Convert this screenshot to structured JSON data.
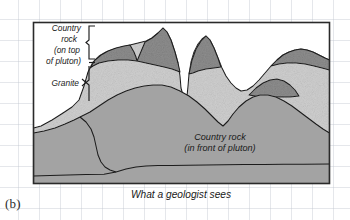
{
  "figure": {
    "panel_label": "(b)",
    "caption": "What a geologist sees"
  },
  "annotations": {
    "country_rock_top": {
      "line1": "Country",
      "line2": "rock",
      "line3": "(on top",
      "line4": "of pluton)"
    },
    "granite": {
      "line1": "Granite"
    },
    "country_rock_front": {
      "line1": "Country rock",
      "line2": "(in front of pluton)"
    }
  },
  "colors": {
    "country_rock_dark": "#8d8d8d",
    "granite_light": "#cfcfcf",
    "country_rock_front": "#a9a9a9",
    "outline": "#1c1c1c",
    "frame": "#2a2a2a",
    "grid": "#bec3cd",
    "background": "#ffffff",
    "text": "#1a1a1a"
  },
  "frame": {
    "x": 33,
    "y": 22,
    "width": 297,
    "height": 162
  },
  "legend_brackets": [
    {
      "name": "country-rock-bracket",
      "top": 25,
      "bottom": 60
    },
    {
      "name": "granite-bracket",
      "top": 64,
      "bottom": 102
    }
  ]
}
